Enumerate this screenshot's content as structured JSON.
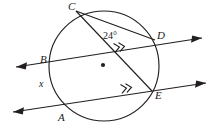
{
  "figure": {
    "kind": "circle-geometry-diagram",
    "stroke_color": "#231f20",
    "background_color": "#ffffff",
    "circle": {
      "cx": 104,
      "cy": 66,
      "r": 55
    },
    "center_dot": {
      "cx": 103,
      "cy": 65,
      "r": 2.1
    },
    "points": [
      {
        "id": "C",
        "label": "C",
        "x": 76,
        "y": 11,
        "label_x": 68,
        "label_y": 1
      },
      {
        "id": "D",
        "label": "D",
        "x": 155,
        "y": 40,
        "label_x": 157,
        "label_y": 30
      },
      {
        "id": "B",
        "label": "B",
        "x": 52,
        "y": 64,
        "label_x": 40,
        "label_y": 54
      },
      {
        "id": "E",
        "label": "E",
        "x": 152,
        "y": 91,
        "label_x": 155,
        "label_y": 90
      },
      {
        "id": "A",
        "label": "A",
        "x": 63,
        "y": 109,
        "label_x": 58,
        "label_y": 112
      }
    ],
    "chords": [
      {
        "id": "chord-CD",
        "from": "C",
        "to": "D"
      },
      {
        "id": "chord-CE",
        "from": "C",
        "to": "E"
      }
    ],
    "secant_lines": [
      {
        "id": "line-BD",
        "through": [
          "B",
          "D"
        ],
        "x1": 16,
        "y1": 67,
        "x2": 202,
        "y2": 38,
        "arrow_start": true,
        "arrow_end": true,
        "tick": {
          "x": 120,
          "y": 47,
          "rotation": -9
        }
      },
      {
        "id": "line-AE",
        "through": [
          "A",
          "E"
        ],
        "x1": 13,
        "y1": 112,
        "x2": 206,
        "y2": 83,
        "arrow_start": true,
        "arrow_end": true,
        "tick": {
          "x": 127,
          "y": 88,
          "rotation": -9
        }
      }
    ],
    "labels": {
      "angle": {
        "text": "24°",
        "x": 103,
        "y": 31
      },
      "unknown_arc": {
        "text": "x",
        "x": 39,
        "y": 79
      }
    },
    "parallel_tick_glyph": "»"
  }
}
